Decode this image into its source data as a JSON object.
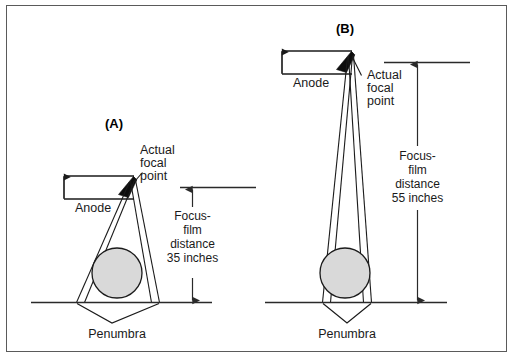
{
  "figure": {
    "title_caption": "",
    "background_color": "#ffffff",
    "frame_color": "#5a5a5a",
    "ink_color": "#1b1b1b",
    "object_fill_color": "#d9d9d9",
    "anode_color": "#0d0d0d"
  },
  "panels": [
    {
      "id": "A",
      "label": "(A)",
      "anode_label": "Anode",
      "focal_point_label_lines": [
        "Actual",
        "focal",
        "point"
      ],
      "focus_film_label_lines": [
        "Focus-",
        "film",
        "distance",
        "35 inches"
      ],
      "distance_value": "35 inches",
      "distance_number": 35,
      "distance_units": "inches",
      "penumbra_label": "Penumbra"
    },
    {
      "id": "B",
      "label": "(B)",
      "anode_label": "Anode",
      "focal_point_label_lines": [
        "Actual",
        "focal",
        "point"
      ],
      "focus_film_label_lines": [
        "Focus-",
        "film",
        "distance",
        "55 inches"
      ],
      "distance_value": "55 inches",
      "distance_number": 55,
      "distance_units": "inches",
      "penumbra_label": "Penumbra"
    }
  ]
}
